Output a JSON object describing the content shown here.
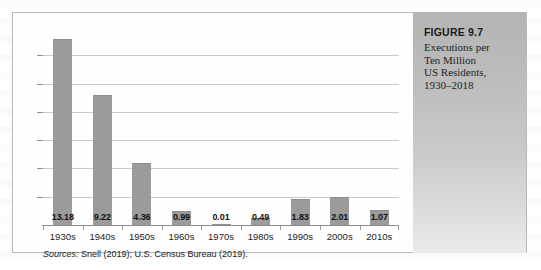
{
  "figure": {
    "number_label": "FIGURE 9.7",
    "title_lines": [
      "Executions per",
      "Ten Million",
      "US Residents,",
      "1930–2018"
    ],
    "sources_label": "Sources:",
    "sources_text": "Snell (2019); U.S. Census Bureau (2019)."
  },
  "colors": {
    "bar": "#9b9b9b",
    "gridline": "#c9c9c9",
    "axis": "#8d8d8d",
    "panel_top": "#b4b4b4",
    "panel_bottom": "#eaeaea",
    "border": "#b9b9b9"
  },
  "chart_data": {
    "type": "bar",
    "xlabel": "",
    "ylabel": "",
    "categories": [
      "1930s",
      "1940s",
      "1950s",
      "1960s",
      "1970s",
      "1980s",
      "1990s",
      "2000s",
      "2010s"
    ],
    "values": [
      13.18,
      9.22,
      4.36,
      0.99,
      0.01,
      0.49,
      1.83,
      2.01,
      1.07
    ],
    "value_labels": [
      "13.18",
      "9.22",
      "4.36",
      "0.99",
      "0.01",
      "0.49",
      "1.83",
      "2.01",
      "1.07"
    ],
    "ylim": [
      0,
      14
    ],
    "ytick_values": [
      2,
      4,
      6,
      8,
      10,
      12
    ],
    "ytick_labels": [],
    "grid": true,
    "legend": null,
    "series": [
      {
        "name": "Executions per ten million US residents",
        "values": [
          13.18,
          9.22,
          4.36,
          0.99,
          0.01,
          0.49,
          1.83,
          2.01,
          1.07
        ]
      }
    ]
  }
}
